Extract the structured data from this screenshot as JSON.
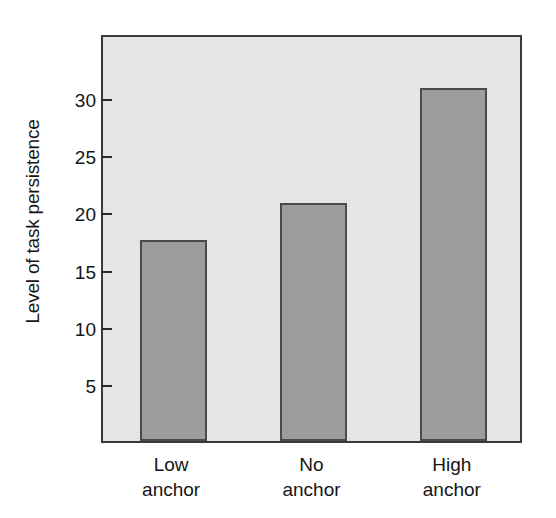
{
  "chart_data": {
    "type": "bar",
    "title": "",
    "subtitle": "",
    "xlabel": "",
    "ylabel": "Level of task persistence",
    "categories": [
      "Low anchor",
      "No anchor",
      "High anchor"
    ],
    "category_lines": [
      {
        "line1": "Low",
        "line2": "anchor"
      },
      {
        "line1": "No",
        "line2": "anchor"
      },
      {
        "line1": "High",
        "line2": "anchor"
      }
    ],
    "values": [
      17.6,
      20.8,
      30.9
    ],
    "ylim": [
      0,
      35.7
    ],
    "yticks": [
      5,
      10,
      15,
      20,
      25,
      30
    ],
    "ytick_labels": [
      "5",
      "10",
      "15",
      "20",
      "25",
      "30"
    ],
    "grid": false,
    "legend": null,
    "legend_position": "none",
    "annotations": [],
    "colors": {
      "bar_fill": "#9d9d9d",
      "bar_edge": "#4a4a4a",
      "plot_background": "#e8e8e8",
      "axis": "#3a3a3a",
      "text": "#151515",
      "figure_background": "#ffffff"
    }
  }
}
